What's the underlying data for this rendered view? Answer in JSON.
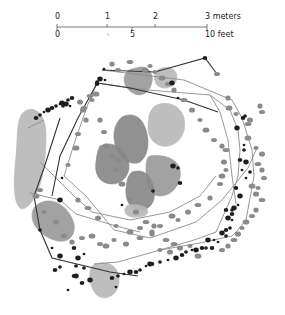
{
  "scale_bar": {
    "meters": {
      "ticks": [
        {
          "label": "0",
          "x": 57
        },
        {
          "label": "1",
          "x": 107
        },
        {
          "label": "2",
          "x": 155
        },
        {
          "label": "3 meters",
          "x": 207
        }
      ]
    },
    "feet": {
      "ticks": [
        {
          "label": "0",
          "x": 57
        },
        {
          "label": "5",
          "x": 132
        },
        {
          "label": "10 feet",
          "x": 207
        }
      ]
    },
    "line": {
      "x1": 57,
      "x2": 207,
      "y": 27
    }
  },
  "colors": {
    "background": "#ffffff",
    "light_feature": "#b8b8b8",
    "mid_feature": "#9a9a9a",
    "dark_feature": "#888888",
    "post_dark": "#1e1e1e",
    "post_gray": "#8a8a8a",
    "line_dark": "#333333",
    "line_gray": "#8c8c8c"
  },
  "features": [
    {
      "kind": "light",
      "path": "M24,112 C34,104 46,114 46,134 C46,156 44,176 38,190 C34,200 26,212 20,208 C12,200 14,176 16,156 C18,136 16,118 24,112 Z"
    },
    {
      "kind": "mid",
      "path": "M40,203 C54,196 70,208 74,224 C76,238 66,244 54,240 C42,236 32,226 32,216 C32,208 36,205 40,203 Z"
    },
    {
      "kind": "light",
      "path": "M96,264 C108,260 120,266 119,282 C118,294 108,300 100,297 C92,294 89,280 90,272 C91,266 93,265 96,264 Z"
    },
    {
      "kind": "mid",
      "path": "M136,68 C146,64 154,72 152,82 C150,92 142,97 135,94 C127,91 122,82 125,75 C127,70 131,69 136,68 Z"
    },
    {
      "kind": "light",
      "path": "M162,68 C170,66 177,70 177,77 C177,84 170,89 163,88 C156,87 153,80 155,74 C156,70 159,69 162,68 Z"
    },
    {
      "kind": "light",
      "path": "M157,105 C166,101 180,104 184,118 C187,132 180,144 168,146 C158,148 148,140 148,128 C148,116 150,108 157,105 Z"
    },
    {
      "kind": "dark",
      "path": "M122,117 C132,112 142,116 146,130 C150,142 148,156 140,162 C132,166 122,160 118,152 C112,140 112,126 122,117 Z"
    },
    {
      "kind": "dark",
      "path": "M100,146 C112,140 124,148 128,160 C132,172 124,184 112,184 C100,184 94,174 96,162 C97,154 98,149 100,146 Z"
    },
    {
      "kind": "mid",
      "path": "M150,156 C162,154 178,158 180,170 C182,184 172,196 160,196 C150,196 146,184 146,172 C146,164 146,158 150,156 Z"
    },
    {
      "kind": "dark",
      "path": "M132,172 C144,168 152,176 154,190 C156,202 150,210 140,210 C130,210 125,200 126,188 C127,180 128,175 132,172 Z"
    },
    {
      "kind": "light",
      "path": "M128,205 C136,204 146,205 148,211 C148,216 140,218 132,217 C126,216 124,212 125,209 C126,207 126,206 128,205 Z"
    }
  ],
  "dark_line_path": "M102,70 L155,72 L205,58 L217,74 M97,83 L130,88 L184,100 L218,112 M60,118 L44,168 L34,196 L40,230 L52,258 L110,272 L138,276 M100,78 L78,118 L60,156 L52,196",
  "gray_line_paths": [
    "M102,70 L184,80 L232,100 L242,118 L252,150 L254,176 L246,220 L238,230 L232,236 L200,243 L160,250 L118,262 L94,264",
    "M97,83 L148,90 L210,95 L230,110 L238,130 L240,150 L238,176 L232,196 L216,232 L194,240 L160,250",
    "M97,83 L88,104 L76,138 L64,176",
    "M64,176 L86,196 L114,230 L150,238 L196,222 L222,200 L248,168 L256,150",
    "M40,162 L74,196 L92,212 L130,220 L170,212 L200,196 L216,176",
    "M30,193 L60,200 L76,214 L96,220 L116,226 L140,232",
    "M28,128 L44,120",
    "M210,95 L220,112 L228,140 L232,176 L236,204"
  ],
  "dark_posts": [
    [
      104,
      69
    ],
    [
      97,
      82
    ],
    [
      97,
      84
    ],
    [
      100,
      79
    ],
    [
      105,
      80
    ],
    [
      68,
      100
    ],
    [
      72,
      98
    ],
    [
      62,
      103
    ],
    [
      60,
      104
    ],
    [
      56,
      106
    ],
    [
      52,
      108
    ],
    [
      48,
      110
    ],
    [
      44,
      112
    ],
    [
      40,
      115
    ],
    [
      36,
      118
    ],
    [
      66,
      104
    ],
    [
      70,
      106
    ],
    [
      63,
      106
    ],
    [
      205,
      58
    ],
    [
      172,
      83
    ],
    [
      178,
      98
    ],
    [
      245,
      116
    ],
    [
      243,
      118
    ],
    [
      237,
      128
    ],
    [
      244,
      145
    ],
    [
      244,
      150
    ],
    [
      240,
      160
    ],
    [
      246,
      162
    ],
    [
      242,
      170
    ],
    [
      250,
      172
    ],
    [
      236,
      188
    ],
    [
      240,
      196
    ],
    [
      238,
      205
    ],
    [
      232,
      210
    ],
    [
      226,
      210
    ],
    [
      228,
      218
    ],
    [
      232,
      220
    ],
    [
      230,
      228
    ],
    [
      226,
      230
    ],
    [
      222,
      233
    ],
    [
      214,
      240
    ],
    [
      206,
      248
    ],
    [
      202,
      248
    ],
    [
      196,
      250
    ],
    [
      192,
      250
    ],
    [
      186,
      252
    ],
    [
      182,
      255
    ],
    [
      176,
      258
    ],
    [
      168,
      260
    ],
    [
      160,
      262
    ],
    [
      152,
      264
    ],
    [
      150,
      264
    ],
    [
      146,
      266
    ],
    [
      140,
      270
    ],
    [
      136,
      272
    ],
    [
      130,
      272
    ],
    [
      124,
      274
    ],
    [
      118,
      276
    ],
    [
      112,
      278
    ],
    [
      60,
      200
    ],
    [
      62,
      178
    ],
    [
      40,
      230
    ],
    [
      74,
      248
    ],
    [
      78,
      258
    ],
    [
      84,
      254
    ],
    [
      76,
      266
    ],
    [
      74,
      276
    ],
    [
      60,
      256
    ],
    [
      52,
      248
    ],
    [
      84,
      268
    ],
    [
      82,
      283
    ],
    [
      90,
      280
    ],
    [
      116,
      287
    ],
    [
      60,
      267
    ],
    [
      55,
      270
    ],
    [
      76,
      276
    ],
    [
      68,
      290
    ],
    [
      153,
      191
    ],
    [
      180,
      183
    ],
    [
      173,
      166
    ],
    [
      122,
      205
    ],
    [
      178,
      168
    ],
    [
      212,
      248
    ],
    [
      208,
      240
    ],
    [
      218,
      242
    ],
    [
      226,
      236
    ],
    [
      232,
      214
    ],
    [
      234,
      208
    ],
    [
      246,
      178
    ]
  ],
  "gray_posts": [
    [
      155,
      72
    ],
    [
      83,
      110
    ],
    [
      90,
      96
    ],
    [
      86,
      120
    ],
    [
      78,
      134
    ],
    [
      76,
      148
    ],
    [
      68,
      165
    ],
    [
      80,
      102
    ],
    [
      84,
      108
    ],
    [
      228,
      98
    ],
    [
      217,
      74
    ],
    [
      229,
      108
    ],
    [
      236,
      114
    ],
    [
      250,
      120
    ],
    [
      248,
      124
    ],
    [
      260,
      106
    ],
    [
      262,
      112
    ],
    [
      248,
      138
    ],
    [
      256,
      148
    ],
    [
      262,
      154
    ],
    [
      258,
      164
    ],
    [
      262,
      170
    ],
    [
      264,
      178
    ],
    [
      252,
      186
    ],
    [
      258,
      188
    ],
    [
      256,
      194
    ],
    [
      262,
      200
    ],
    [
      256,
      210
    ],
    [
      252,
      216
    ],
    [
      246,
      222
    ],
    [
      242,
      228
    ],
    [
      238,
      234
    ],
    [
      234,
      240
    ],
    [
      228,
      246
    ],
    [
      222,
      250
    ],
    [
      198,
      256
    ],
    [
      190,
      246
    ],
    [
      180,
      248
    ],
    [
      166,
      240
    ],
    [
      152,
      232
    ],
    [
      140,
      228
    ],
    [
      130,
      232
    ],
    [
      116,
      226
    ],
    [
      98,
      218
    ],
    [
      88,
      208
    ],
    [
      78,
      200
    ],
    [
      100,
      244
    ],
    [
      106,
      246
    ],
    [
      114,
      240
    ],
    [
      126,
      244
    ],
    [
      140,
      238
    ],
    [
      152,
      234
    ],
    [
      160,
      226
    ],
    [
      172,
      216
    ],
    [
      178,
      220
    ],
    [
      188,
      212
    ],
    [
      198,
      205
    ],
    [
      210,
      198
    ],
    [
      220,
      184
    ],
    [
      222,
      176
    ],
    [
      226,
      170
    ],
    [
      224,
      162
    ],
    [
      226,
      150
    ],
    [
      222,
      146
    ],
    [
      214,
      140
    ],
    [
      206,
      130
    ],
    [
      200,
      120
    ],
    [
      192,
      110
    ],
    [
      184,
      100
    ],
    [
      174,
      90
    ],
    [
      168,
      84
    ],
    [
      162,
      78
    ],
    [
      150,
      66
    ],
    [
      145,
      70
    ],
    [
      130,
      62
    ],
    [
      112,
      64
    ],
    [
      118,
      70
    ],
    [
      96,
      94
    ],
    [
      92,
      100
    ],
    [
      106,
      146
    ],
    [
      112,
      156
    ],
    [
      118,
      160
    ],
    [
      116,
      170
    ],
    [
      122,
      184
    ],
    [
      130,
      200
    ],
    [
      136,
      212
    ],
    [
      146,
      222
    ],
    [
      154,
      226
    ],
    [
      40,
      190
    ],
    [
      36,
      196
    ],
    [
      44,
      212
    ],
    [
      56,
      222
    ],
    [
      64,
      236
    ],
    [
      72,
      242
    ],
    [
      82,
      238
    ],
    [
      92,
      236
    ],
    [
      160,
      250
    ],
    [
      170,
      252
    ],
    [
      174,
      244
    ],
    [
      100,
      120
    ],
    [
      104,
      132
    ]
  ]
}
